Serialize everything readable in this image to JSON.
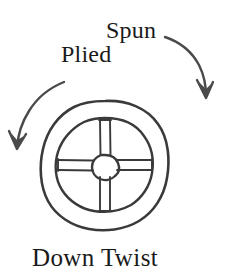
{
  "figure": {
    "title": "Down Twist",
    "background_color": "#ffffff",
    "ink_color": "#333333",
    "text_color": "#1a1a1a",
    "width": 228,
    "height": 276
  },
  "labels": {
    "spun": "Spun",
    "plied": "Plied",
    "down_twist": "Down Twist"
  },
  "arrows": [
    {
      "name": "spun-arrow",
      "label": "Spun",
      "direction": "clockwise-down-right",
      "head_position": "down",
      "start": [
        166,
        37
      ],
      "end": [
        206,
        96
      ]
    },
    {
      "name": "plied-arrow",
      "label": "Plied",
      "direction": "counterclockwise-down-left",
      "head_position": "down-left",
      "start": [
        64,
        82
      ],
      "end": [
        17,
        147
      ]
    }
  ],
  "whorl": {
    "name": "spindle-whorl",
    "center": [
      105,
      165
    ],
    "outer_radius": 64,
    "inner_radius": 47,
    "hub_radius": 11,
    "spoke_count": 4,
    "spoke_angles_deg": [
      0,
      90,
      180,
      270
    ],
    "spoke_style": "double-line"
  }
}
